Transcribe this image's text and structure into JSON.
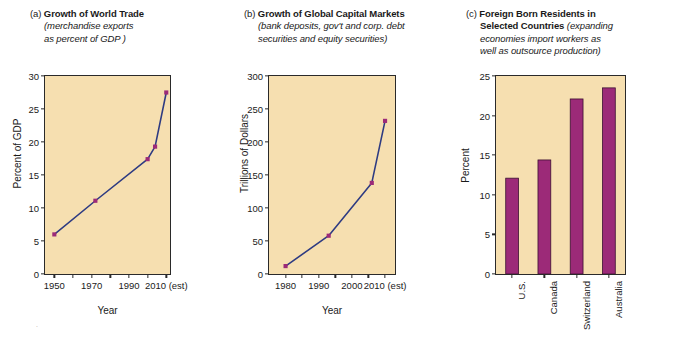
{
  "figure": {
    "background": "#ffffff",
    "plot_background": "#f6dfb0",
    "line_color": "#2e3b82",
    "marker_color": "#9c2a78",
    "bar_color": "#9c2a78",
    "axis_color": "#2a2a2a"
  },
  "panels": [
    {
      "id": "a",
      "letter": "(a)",
      "title_bold": "Growth of World Trade",
      "subtitle_line1": "(merchandise exports",
      "subtitle_line2": "as percent of GDP )"
    },
    {
      "id": "b",
      "letter": "(b)",
      "title_bold": "Growth of Global Capital Markets",
      "subtitle_line1": "(bank deposits, gov't and corp. debt",
      "subtitle_line2": "securities and equity securities)"
    },
    {
      "id": "c",
      "letter": "(c)",
      "title_bold_line1": "Foreign Born Residents in",
      "title_bold_line2": "Selected Countries",
      "subtitle_line2_italic": "(expanding",
      "subtitle_line3": "economies import workers as",
      "subtitle_line4": "well as outsource production)"
    }
  ],
  "chart_data": [
    {
      "type": "line",
      "panel": "a",
      "title": "(a) Growth of World Trade (merchandise exports as percent of GDP )",
      "xlabel": "Year",
      "ylabel": "Percent of GDP",
      "xlim": [
        1945,
        2012
      ],
      "ylim": [
        0,
        30
      ],
      "yticks": [
        0,
        5,
        10,
        15,
        20,
        25,
        30
      ],
      "ytick_labels": [
        "0",
        "5",
        "10",
        "15",
        "20",
        "25",
        "30"
      ],
      "xticks": [
        1950,
        1960,
        1970,
        1980,
        1990,
        2000,
        2010
      ],
      "xtick_labels": [
        "1950",
        "",
        "1970",
        "",
        "1990",
        "",
        "2010 (est)"
      ],
      "grid": false,
      "legend": "none",
      "x": [
        1950,
        1972,
        2000,
        2004,
        2010
      ],
      "values": [
        6.0,
        11.1,
        17.4,
        19.3,
        27.5
      ],
      "marker": "square"
    },
    {
      "type": "line",
      "panel": "b",
      "title": "(b) Growth of Global Capital Markets (bank deposits, gov't and corp. debt securities and equity securities)",
      "xlabel": "Year",
      "ylabel": "Trillions of Dollars",
      "xlim": [
        1975,
        2013
      ],
      "ylim": [
        0,
        300
      ],
      "yticks": [
        0,
        50,
        100,
        150,
        200,
        250,
        300
      ],
      "ytick_labels": [
        "0",
        "50",
        "100",
        "150",
        "200",
        "250",
        "300"
      ],
      "xticks": [
        1980,
        1985,
        1990,
        1995,
        2000,
        2005,
        2010
      ],
      "xtick_labels": [
        "1980",
        "",
        "1990",
        "",
        "2000",
        "",
        "2010 (est)"
      ],
      "grid": false,
      "legend": "none",
      "x": [
        1980,
        1993,
        2006,
        2010
      ],
      "values": [
        12,
        58,
        138,
        232
      ],
      "marker": "square"
    },
    {
      "type": "bar",
      "panel": "c",
      "title": "(c) Foreign Born Residents in Selected Countries (expanding economies import workers as well as outsource production)",
      "xlabel": "",
      "ylabel": "Percent",
      "ylim": [
        0,
        25
      ],
      "yticks": [
        0,
        5,
        10,
        15,
        20,
        25
      ],
      "ytick_labels": [
        "0",
        "5",
        "10",
        "15",
        "20",
        "25"
      ],
      "grid": false,
      "legend": "none",
      "categories": [
        "U.S.",
        "Canada",
        "Switzerland",
        "Australia"
      ],
      "values": [
        12.1,
        14.4,
        22.1,
        23.5
      ]
    }
  ]
}
